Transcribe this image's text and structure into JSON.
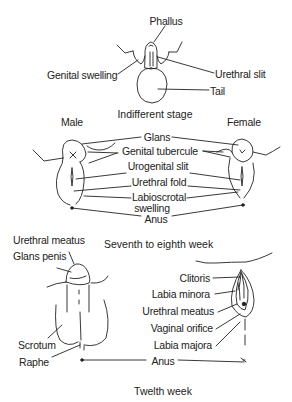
{
  "indifferent_stage": {
    "caption": "Indifferent stage",
    "labels": {
      "phallus": "Phallus",
      "genital_swelling": "Genital swelling",
      "urethral_slit": "Urethral slit",
      "tail": "Tail"
    }
  },
  "seventh_eighth_week": {
    "caption": "Seventh to eighth week",
    "male_heading": "Male",
    "female_heading": "Female",
    "labels": {
      "glans": "Glans",
      "genital_tubercule": "Genital tubercule",
      "urogenital_slit": "Urogenital slit",
      "urethral_fold": "Urethral fold",
      "labioscrotal_1": "Labioscrotal",
      "labioscrotal_2": "swelling",
      "anus": "Anus"
    }
  },
  "twelfth_week": {
    "caption": "Twelth week",
    "male_labels": {
      "urethral_meatus": "Urethral meatus",
      "glans_penis": "Glans penis",
      "scrotum": "Scrotum",
      "raphe": "Raphe"
    },
    "female_labels": {
      "clitoris": "Clitoris",
      "labia_minora": "Labia minora",
      "urethral_meatus": "Urethral meatus",
      "vaginal_orifice": "Vaginal orifice",
      "labia_majora": "Labia majora"
    },
    "anus": "Anus"
  },
  "colors": {
    "ink": "#222222",
    "background": "#ffffff"
  }
}
